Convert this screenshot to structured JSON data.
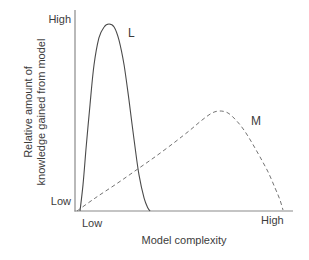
{
  "chart_data": {
    "type": "line",
    "title": "",
    "xlabel": "Model complexity",
    "ylabel_line1": "Relative amount of",
    "ylabel_line2": "knowledge gained from model",
    "x_tick_low": "Low",
    "x_tick_high": "High",
    "y_tick_low": "Low",
    "y_tick_high": "High",
    "axis_color": "#8a8a8a",
    "text_color": "#3c3c3c",
    "xlim": [
      0,
      1
    ],
    "ylim": [
      0,
      1
    ],
    "grid": false,
    "legend_position": "inline-labels",
    "series": [
      {
        "name": "L",
        "line_style": "solid",
        "color": "#4a4a4a",
        "label_pos": [
          0.239,
          0.939
        ],
        "points": [
          [
            0.014,
            0.0
          ],
          [
            0.028,
            0.133
          ],
          [
            0.042,
            0.311
          ],
          [
            0.061,
            0.541
          ],
          [
            0.08,
            0.745
          ],
          [
            0.103,
            0.883
          ],
          [
            0.127,
            0.939
          ],
          [
            0.15,
            0.954
          ],
          [
            0.174,
            0.939
          ],
          [
            0.197,
            0.872
          ],
          [
            0.221,
            0.745
          ],
          [
            0.244,
            0.566
          ],
          [
            0.268,
            0.362
          ],
          [
            0.291,
            0.184
          ],
          [
            0.315,
            0.066
          ],
          [
            0.333,
            0.015
          ],
          [
            0.343,
            0.0
          ]
        ]
      },
      {
        "name": "M",
        "line_style": "dashed",
        "color": "#737373",
        "label_pos": [
          0.817,
          0.49
        ],
        "points": [
          [
            0.0,
            0.0
          ],
          [
            0.085,
            0.066
          ],
          [
            0.178,
            0.133
          ],
          [
            0.272,
            0.204
          ],
          [
            0.366,
            0.276
          ],
          [
            0.46,
            0.352
          ],
          [
            0.531,
            0.413
          ],
          [
            0.587,
            0.464
          ],
          [
            0.634,
            0.5
          ],
          [
            0.671,
            0.51
          ],
          [
            0.709,
            0.5
          ],
          [
            0.746,
            0.464
          ],
          [
            0.784,
            0.413
          ],
          [
            0.822,
            0.347
          ],
          [
            0.859,
            0.276
          ],
          [
            0.897,
            0.199
          ],
          [
            0.93,
            0.117
          ],
          [
            0.953,
            0.056
          ],
          [
            0.967,
            0.005
          ]
        ]
      }
    ]
  }
}
